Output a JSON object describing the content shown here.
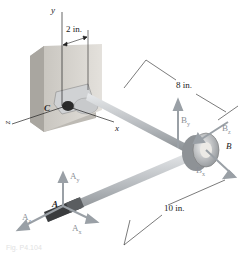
{
  "figure": {
    "axes": {
      "y": "y",
      "x": "x",
      "z": "z"
    },
    "points": {
      "A": "A",
      "B": "B",
      "C": "C"
    },
    "dimensions": {
      "offset": "2 in.",
      "arm_length": "8 in.",
      "rod_length": "10 in."
    },
    "forces": {
      "Ay": "A",
      "Ay_sub": "y",
      "Ax": "A",
      "Ax_sub": "x",
      "Az": "A",
      "Az_sub": "z",
      "By": "B",
      "By_sub": "y",
      "Bx": "B",
      "Bx_sub": "x",
      "Bz": "B",
      "Bz_sub": "z"
    },
    "caption": "Fig. P4.104",
    "colors": {
      "force_arrow": "#9aa0a6",
      "rod": "#b8bcc0",
      "wall": "#d9d6d0",
      "dim_line": "#222222"
    }
  }
}
